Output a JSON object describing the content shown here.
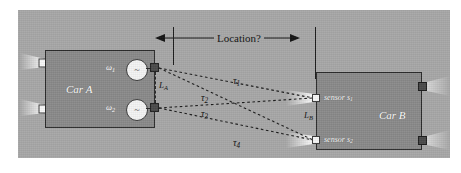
{
  "figure": {
    "caption_implied": "Two-car ultrasonic/RF localization geometry",
    "background_color": "#a8a8a8"
  },
  "car_a": {
    "label": "Car A",
    "oscillators": [
      {
        "id": "osc-1",
        "tag": "ω",
        "subscript": "1",
        "glyph": "~"
      },
      {
        "id": "osc-2",
        "tag": "ω",
        "subscript": "2",
        "glyph": "~"
      }
    ],
    "baseline": {
      "symbol": "L",
      "subscript": "A"
    }
  },
  "car_b": {
    "label": "Car B",
    "processor_label": "uP",
    "sensors": [
      {
        "id": "sensor-1",
        "label": "sensor s",
        "subscript": "1"
      },
      {
        "id": "sensor-2",
        "label": "sensor s",
        "subscript": "2"
      }
    ],
    "baseline": {
      "symbol": "L",
      "subscript": "B"
    }
  },
  "measurement": {
    "question_label": "Location?",
    "delays": [
      {
        "id": "tau-1",
        "symbol": "τ",
        "subscript": "1",
        "from": "osc-1",
        "to": "sensor-1"
      },
      {
        "id": "tau-2",
        "symbol": "τ",
        "subscript": "2",
        "from": "osc-1",
        "to": "sensor-2"
      },
      {
        "id": "tau-3",
        "symbol": "τ",
        "subscript": "3",
        "from": "osc-2",
        "to": "sensor-1"
      },
      {
        "id": "tau-4",
        "symbol": "τ",
        "subscript": "4",
        "from": "osc-2",
        "to": "sensor-2"
      }
    ]
  },
  "colors": {
    "scene_gray": "#a8a8a8",
    "car_gray": "#8a8a8a",
    "outline": "#2b2b2b",
    "sensor_white": "#f6f6f6",
    "antenna_dark": "#4a4a4a",
    "text_light": "#ffffff",
    "text_dark": "#111111"
  }
}
